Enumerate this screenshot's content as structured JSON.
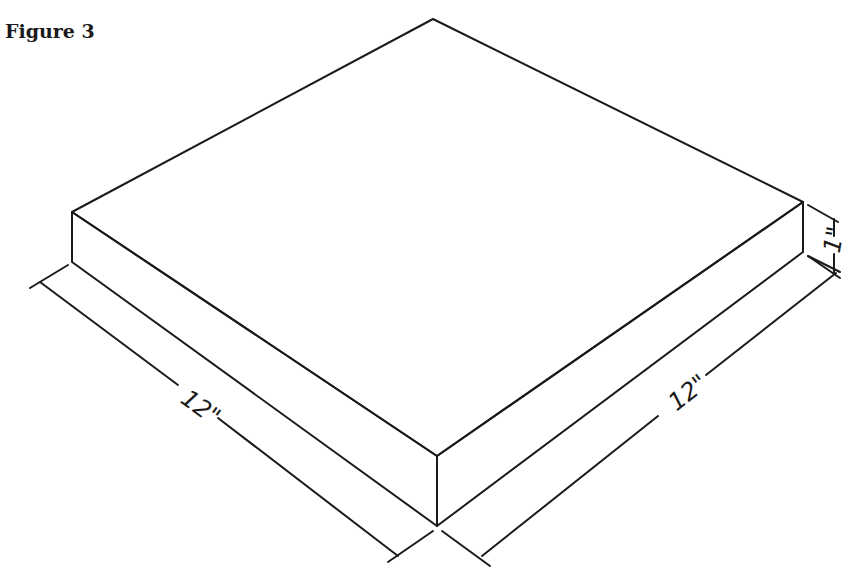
{
  "figure": {
    "title": "Figure 3",
    "dimensions": {
      "length_label": "12\"",
      "width_label": "12\"",
      "height_label": "1\""
    },
    "shaded_face": "front-left side",
    "colors": {
      "line": "#1a1a1a",
      "background": "#ffffff",
      "shade": "#9a9a9a"
    }
  }
}
